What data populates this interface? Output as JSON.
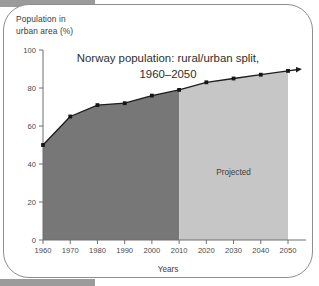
{
  "figure": {
    "y_axis_caption_line1": "Population in",
    "y_axis_caption_line2": "urban area (%)",
    "annotation_projected": "Projected",
    "x_axis_caption": "Years"
  },
  "colors": {
    "historical_fill": "#777777",
    "projected_fill": "#c6c6c6",
    "line": "#1c1c1c",
    "axis": "#6f6f6f",
    "frame_border": "#8e8e8e",
    "band": "#9b9b9b"
  },
  "chart_data": {
    "type": "area",
    "title": "Norway population: rural/urban split,",
    "title_line2": "1960–2050",
    "xlabel": "Years",
    "ylabel": "Population in urban area (%)",
    "categories": [
      "1960",
      "1970",
      "1980",
      "1990",
      "2000",
      "2010",
      "2020",
      "2030",
      "2040",
      "2050"
    ],
    "x": [
      1960,
      1970,
      1980,
      1990,
      2000,
      2010,
      2020,
      2030,
      2040,
      2050
    ],
    "values": [
      50,
      65,
      71,
      72,
      76,
      79,
      83,
      85,
      87,
      89
    ],
    "series": [
      {
        "name": "Urban population share (%)",
        "values": [
          50,
          65,
          71,
          72,
          76,
          79,
          83,
          85,
          87,
          89
        ]
      }
    ],
    "xlim": [
      1960,
      2050
    ],
    "ylim": [
      0,
      100
    ],
    "ytick_labels": [
      "0",
      "20",
      "40",
      "60",
      "80",
      "100"
    ],
    "yticks": [
      0,
      20,
      40,
      60,
      80,
      100
    ],
    "xtick_labels": [
      "1960",
      "1970",
      "1980",
      "1990",
      "2000",
      "2010",
      "2020",
      "2030",
      "2040",
      "2050"
    ],
    "grid": false,
    "legend": "none",
    "annotations": [
      {
        "text": "Projected",
        "x": 2030,
        "y": 34
      }
    ],
    "regions": [
      {
        "name": "historical",
        "x_start": 1960,
        "x_end": 2010,
        "fill": "#777777"
      },
      {
        "name": "projected",
        "x_start": 2010,
        "x_end": 2050,
        "fill": "#c6c6c6"
      }
    ]
  }
}
